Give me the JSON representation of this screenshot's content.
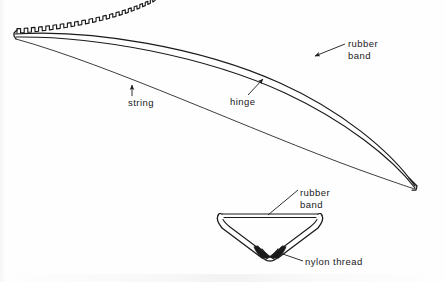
{
  "figure": {
    "background_color": "#fefefe",
    "ink_color": "#1a1a1a"
  },
  "labels": {
    "rubber_band_top_line1": "rubber",
    "rubber_band_top_line2": "band",
    "string": "string",
    "hinge": "hinge",
    "rubber_band_bottom_line1": "rubber",
    "rubber_band_bottom_line2": "band",
    "nylon_thread": "nylon thread"
  },
  "parts": [
    {
      "name": "toothed-rubber-band-edge",
      "label": "rubber band",
      "description": "castellated square-tooth band running along the upper convex edge of the curved wing from the blunt left tip to the pointed right tip",
      "tooth_count": 44,
      "tooth_pitch_px": 5.2,
      "tooth_height_px": 3.4
    },
    {
      "name": "hinge-line",
      "label": "hinge",
      "description": "middle curved line of the wing, drawn slightly heavier than the string line"
    },
    {
      "name": "string-line",
      "label": "string",
      "description": "lowest thin curved line spanning from the blunt left tip to the pointed right tip"
    },
    {
      "name": "wing-left-tip",
      "description": "blunt squared-off vertical end at the left where the three curves converge"
    },
    {
      "name": "wing-right-tip",
      "description": "narrow pointed end at lower right where the three curves converge"
    },
    {
      "name": "cross-section-v",
      "label": "rubber band / nylon thread",
      "description": "lower detail view: shallow V of two tubular limbs meeting at a crossed bottom vertex, closed across the top by a straight rubber band"
    },
    {
      "name": "nylon-thread-vertex",
      "label": "nylon thread",
      "description": "dark crossed binding at the bottom vertex of the V detail"
    }
  ],
  "leaders": [
    {
      "name": "leader-rubber-band-top",
      "from_label": "rubber band",
      "style": "arrow",
      "direction": "down-left toward toothed edge"
    },
    {
      "name": "leader-string",
      "from_label": "string",
      "style": "arrow",
      "direction": "straight up to string line"
    },
    {
      "name": "leader-hinge",
      "from_label": "hinge",
      "style": "arrow",
      "direction": "up-right to hinge line"
    },
    {
      "name": "leader-rubber-band-bottom",
      "from_label": "rubber band",
      "style": "plain line",
      "direction": "down-left to top bar of V"
    },
    {
      "name": "leader-nylon-thread",
      "from_label": "nylon thread",
      "style": "plain line",
      "direction": "left to vertex of V"
    }
  ]
}
